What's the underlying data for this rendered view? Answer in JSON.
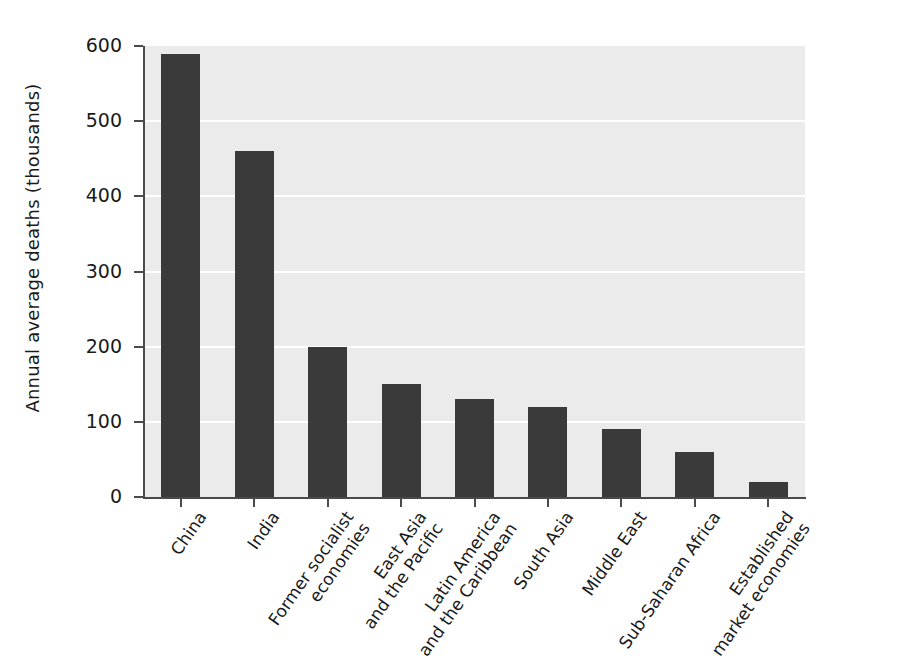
{
  "chart_data": {
    "type": "bar",
    "title": "",
    "xlabel": "",
    "ylabel": "Annual average deaths (thousands)",
    "ylim": [
      0,
      600
    ],
    "ytick_labels": [
      "0",
      "100",
      "200",
      "300",
      "400",
      "500",
      "600"
    ],
    "ytick_values": [
      0,
      100,
      200,
      300,
      400,
      500,
      600
    ],
    "grid": "horizontal-white-gridlines",
    "legend": "none",
    "bar_color": "#3a3a3a",
    "plot_background": "#ebebeb",
    "categories": [
      "China",
      "India",
      "Former socialist economies",
      "East Asia and the Pacific",
      "Latin America and the Caribbean",
      "South Asia",
      "Middle East",
      "Sub-Saharan Africa",
      "Established market economies"
    ],
    "category_label_lines": [
      [
        "China",
        ""
      ],
      [
        "India",
        ""
      ],
      [
        "Former socialist",
        "economies"
      ],
      [
        "East Asia",
        "and the Pacific"
      ],
      [
        "Latin America",
        "and the Caribbean"
      ],
      [
        "South Asia",
        ""
      ],
      [
        "Middle East",
        ""
      ],
      [
        "Sub-Saharan Africa",
        ""
      ],
      [
        "Established",
        "market economies"
      ]
    ],
    "values": [
      590,
      460,
      200,
      150,
      130,
      120,
      90,
      60,
      20
    ]
  }
}
